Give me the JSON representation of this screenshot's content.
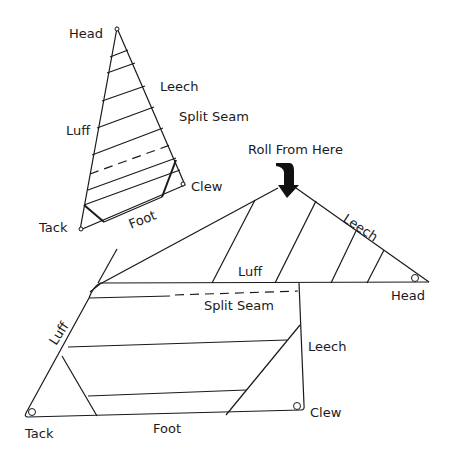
{
  "diagram": {
    "colors": {
      "line": "#1a1a1a",
      "background": "#ffffff"
    },
    "flat_sail": {
      "labels": {
        "head": "Head",
        "leech": "Leech",
        "split_seam": "Split Seam",
        "luff": "Luff",
        "clew": "Clew",
        "tack": "Tack",
        "foot": "Foot"
      }
    },
    "folded_sail": {
      "instruction": "Roll From Here",
      "instruction_icon": "down-arrow-icon",
      "labels": {
        "leech_upper": "Leech",
        "luff_upper": "Luff",
        "head": "Head",
        "split_seam": "Split Seam",
        "luff_left": "Luff",
        "leech_right": "Leech",
        "clew": "Clew",
        "tack": "Tack",
        "foot": "Foot"
      }
    }
  }
}
